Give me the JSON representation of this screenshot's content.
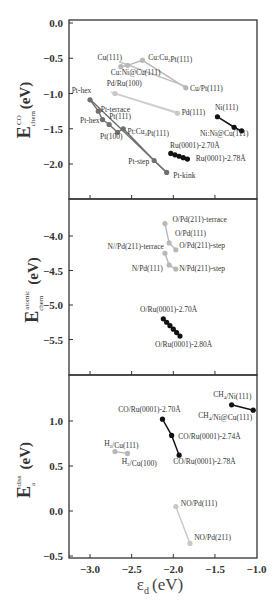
{
  "chart_data": [
    {
      "type": "scatter",
      "panel": "top",
      "ylabel": "E_chem^CO (eV)",
      "ylabel_main": "E",
      "ylabel_sup": "CO",
      "ylabel_sub": "chem",
      "ylabel_unit": "(eV)",
      "ylim": [
        -2.4,
        0.0
      ],
      "yticks": [
        "0.0",
        "-0.5",
        "-1.0",
        "-1.5",
        "-2.0"
      ],
      "ytick_values": [
        0.0,
        -0.5,
        -1.0,
        -1.5,
        -2.0
      ],
      "series": [
        {
          "name": "Cu-group",
          "color": "#b8b8b8",
          "points": [
            {
              "label": "Cu(111)",
              "x": -2.63,
              "y": -0.62
            },
            {
              "label": "Cu:Ni@Cu(111)",
              "x": -2.55,
              "y": -0.6
            },
            {
              "label": "Cu:Cu3Pt(111)",
              "x": -2.37,
              "y": -0.53
            },
            {
              "label": "Cu/Pt(111)",
              "x": -1.85,
              "y": -0.92
            }
          ]
        },
        {
          "name": "Pd-group",
          "color": "#c8c8c8",
          "points": [
            {
              "label": "Pd/Ru(100)",
              "x": -2.7,
              "y": -1.0
            },
            {
              "label": "Pd(111)",
              "x": -1.95,
              "y": -1.28
            }
          ]
        },
        {
          "name": "Pt-group",
          "color": "#707070",
          "points": [
            {
              "label": "Pt-hex",
              "x": -3.0,
              "y": -1.09
            },
            {
              "label": "Pt-terrace",
              "x": -2.9,
              "y": -1.25
            },
            {
              "label": "Pt-hex",
              "x": -2.85,
              "y": -1.37
            },
            {
              "label": "Pt(111)",
              "x": -2.77,
              "y": -1.44
            },
            {
              "label": "Pt(100)",
              "x": -2.67,
              "y": -1.55
            },
            {
              "label": "Pt:Cu3Pt(111)",
              "x": -2.6,
              "y": -1.5
            },
            {
              "label": "Pt-step",
              "x": -2.23,
              "y": -1.95
            },
            {
              "label": "Pt-kink",
              "x": -2.08,
              "y": -2.12
            }
          ]
        },
        {
          "name": "Ni-group",
          "color": "#111111",
          "points": [
            {
              "label": "Ni(111)",
              "x": -1.47,
              "y": -1.33
            },
            {
              "label": "",
              "x": -1.27,
              "y": -1.48
            },
            {
              "label": "Ni:Ni@Cu(111)",
              "x": -1.18,
              "y": -1.53
            }
          ]
        },
        {
          "name": "Ru(0001) strain",
          "color": "#111111",
          "points": [
            {
              "label": "Ru(0001)-2.70Å",
              "x": -2.03,
              "y": -1.85
            },
            {
              "label": "",
              "x": -1.98,
              "y": -1.87
            },
            {
              "label": "",
              "x": -1.93,
              "y": -1.89
            },
            {
              "label": "",
              "x": -1.88,
              "y": -1.91
            },
            {
              "label": "Ru(0001)-2.78Å",
              "x": -1.83,
              "y": -1.93
            }
          ]
        }
      ],
      "lines": [
        {
          "color": "#c0c0c0",
          "from": [
            -2.65,
            -0.55
          ],
          "to": [
            -1.85,
            -0.9
          ]
        },
        {
          "color": "#d0d0d0",
          "from": [
            -2.75,
            -0.98
          ],
          "to": [
            -1.95,
            -1.27
          ]
        },
        {
          "color": "#707070",
          "from": [
            -3.0,
            -1.08
          ],
          "to": [
            -2.08,
            -2.12
          ]
        },
        {
          "color": "#222222",
          "from": [
            -1.47,
            -1.33
          ],
          "to": [
            -1.18,
            -1.54
          ]
        },
        {
          "color": "#111111",
          "from": [
            -2.03,
            -1.85
          ],
          "to": [
            -1.83,
            -1.93
          ]
        }
      ],
      "annotations": [
        {
          "text": "Cu(111)",
          "x": -2.91,
          "y": -0.52
        },
        {
          "text": "Cu:Cu3Pt(111)",
          "x": -2.3,
          "y": -0.52
        },
        {
          "text": "Cu:Ni@Cu(111)",
          "x": -2.75,
          "y": -0.74
        },
        {
          "text": "Pd/Ru(100)",
          "x": -2.8,
          "y": -0.9
        },
        {
          "text": "Cu/Pt(111)",
          "x": -1.8,
          "y": -0.97
        },
        {
          "text": "Pt-hex",
          "x": -3.22,
          "y": -0.99
        },
        {
          "text": "Pt-terrace",
          "x": -2.87,
          "y": -1.26
        },
        {
          "text": "Pd(111)",
          "x": -1.9,
          "y": -1.3
        },
        {
          "text": "Ni(111)",
          "x": -1.5,
          "y": -1.24
        },
        {
          "text": "Pt(111)",
          "x": -2.77,
          "y": -1.36
        },
        {
          "text": "Pt-hex",
          "x": -3.12,
          "y": -1.42
        },
        {
          "text": "Pt:Cu3Pt(111)",
          "x": -2.55,
          "y": -1.58
        },
        {
          "text": "Ni:Ni@Cu(111)",
          "x": -1.68,
          "y": -1.6
        },
        {
          "text": "Pt(100)",
          "x": -2.88,
          "y": -1.65
        },
        {
          "text": "Ru(0001)-2.70Å",
          "x": -2.04,
          "y": -1.77
        },
        {
          "text": "Ru(0001)-2.78Å",
          "x": -1.73,
          "y": -1.96
        },
        {
          "text": "Pt-step",
          "x": -2.54,
          "y": -2.0
        },
        {
          "text": "Pt-kink",
          "x": -2.0,
          "y": -2.2
        }
      ]
    },
    {
      "type": "scatter",
      "panel": "middle",
      "ylabel": "E_chem^atomic (eV)",
      "ylabel_main": "E",
      "ylabel_sup": "atomic",
      "ylabel_sub": "chem",
      "ylabel_unit": "(eV)",
      "ylim": [
        -5.95,
        -3.6
      ],
      "yticks": [
        "-4.0",
        "-4.5",
        "-5.0",
        "-5.5"
      ],
      "ytick_values": [
        -4.0,
        -4.5,
        -5.0,
        -5.5
      ],
      "series": [
        {
          "name": "O/Pd",
          "color": "#b8b8b8",
          "points": [
            {
              "label": "O/Pd(211)-terrace",
              "x": -2.1,
              "y": -3.82
            },
            {
              "label": "O/Pd(111)",
              "x": -2.05,
              "y": -4.1
            },
            {
              "label": "O/Pd(211)-step",
              "x": -1.97,
              "y": -4.2
            }
          ]
        },
        {
          "name": "N/Pd",
          "color": "#b8b8b8",
          "points": [
            {
              "label": "N//Pd(211)-terrace",
              "x": -2.1,
              "y": -4.25
            },
            {
              "label": "N/Pd(111)",
              "x": -2.05,
              "y": -4.42
            },
            {
              "label": "N/Pd(211)-step",
              "x": -1.97,
              "y": -4.48
            }
          ]
        },
        {
          "name": "O/Ru(0001) strain",
          "color": "#111111",
          "points": [
            {
              "label": "O/Ru(0001)-2.70Å",
              "x": -2.12,
              "y": -5.2
            },
            {
              "label": "",
              "x": -2.08,
              "y": -5.25
            },
            {
              "label": "",
              "x": -2.04,
              "y": -5.3
            },
            {
              "label": "",
              "x": -2.0,
              "y": -5.35
            },
            {
              "label": "",
              "x": -1.96,
              "y": -5.4
            },
            {
              "label": "O/Ru(0001)-2.80Å",
              "x": -1.92,
              "y": -5.45
            }
          ]
        }
      ],
      "annotations": [
        {
          "text": "O/Pd(211)-terrace",
          "x": -2.01,
          "y": -3.8
        },
        {
          "text": "O/Pd(111)",
          "x": -1.98,
          "y": -4.0
        },
        {
          "text": "O/Pd(211)-step",
          "x": -1.93,
          "y": -4.18
        },
        {
          "text": "N//Pd(211)-terrace",
          "x": -2.79,
          "y": -4.19
        },
        {
          "text": "N/Pd(111)",
          "x": -2.5,
          "y": -4.5
        },
        {
          "text": "N/Pd(211)-step",
          "x": -1.93,
          "y": -4.5
        },
        {
          "text": "O/Ru(0001)-2.70Å",
          "x": -2.4,
          "y": -5.1
        },
        {
          "text": "O/Ru(0001)-2.80Å",
          "x": -2.22,
          "y": -5.61
        }
      ]
    },
    {
      "type": "scatter",
      "panel": "bottom",
      "xlabel": "ε_d (eV)",
      "xlabel_main": "ε",
      "xlabel_sub": "d",
      "xlabel_unit": "(eV)",
      "xlim": [
        -3.25,
        -1.0
      ],
      "xticks": [
        "-3.0",
        "-2.5",
        "-2.0",
        "-1.5",
        "-1.0"
      ],
      "xtick_values": [
        -3.0,
        -2.5,
        -2.0,
        -1.5,
        -1.0
      ],
      "ylabel": "E_a^diss (eV)",
      "ylabel_main": "E",
      "ylabel_sup": "diss",
      "ylabel_sub": "a",
      "ylabel_unit": "(eV)",
      "ylim": [
        -0.5,
        1.5
      ],
      "yticks": [
        "1.0",
        "0.5",
        "0.0",
        "-0.5"
      ],
      "ytick_values": [
        1.0,
        0.5,
        0.0,
        -0.5
      ],
      "series": [
        {
          "name": "CH4/Ni",
          "color": "#111111",
          "points": [
            {
              "label": "CH4/Ni(111)",
              "x": -1.3,
              "y": 1.18
            },
            {
              "label": "CH4/Ni@Cu(111)",
              "x": -1.04,
              "y": 1.12
            }
          ]
        },
        {
          "name": "CO/Ru(0001) strain",
          "color": "#111111",
          "points": [
            {
              "label": "CO/Ru(0001)-2.70Å",
              "x": -2.13,
              "y": 1.02
            },
            {
              "label": "CO/Ru(0001)-2.74Å",
              "x": -2.02,
              "y": 0.84
            },
            {
              "label": "CO/Ru(0001)-2.78Å",
              "x": -1.93,
              "y": 0.62
            }
          ]
        },
        {
          "name": "H2/Cu",
          "color": "#b8b8b8",
          "points": [
            {
              "label": "H2/Cu(111)",
              "x": -2.7,
              "y": 0.66
            },
            {
              "label": "H2/Cu(100)",
              "x": -2.55,
              "y": 0.64
            }
          ]
        },
        {
          "name": "NO/Pd",
          "color": "#c8c8c8",
          "points": [
            {
              "label": "NO/Pd(111)",
              "x": -1.97,
              "y": 0.05
            },
            {
              "label": "NO/Pd(211)",
              "x": -1.8,
              "y": -0.36
            }
          ]
        }
      ],
      "annotations": [
        {
          "text": "CH4/Ni(111)",
          "x": -1.52,
          "y": 1.27
        },
        {
          "text": "CO/Ru(0001)-2.70Å",
          "x": -2.66,
          "y": 1.1
        },
        {
          "text": "CH4/Ni@Cu(111)",
          "x": -1.7,
          "y": 1.03
        },
        {
          "text": "CO/Ru(0001)-2.74Å",
          "x": -1.94,
          "y": 0.8
        },
        {
          "text": "H2/Cu(111)",
          "x": -2.83,
          "y": 0.72
        },
        {
          "text": "H2/Cu(100)",
          "x": -2.62,
          "y": 0.52
        },
        {
          "text": "CO/Ru(0001)-2.78Å",
          "x": -2.0,
          "y": 0.52
        },
        {
          "text": "NO/Pd(111)",
          "x": -1.91,
          "y": 0.06
        },
        {
          "text": "NO/Pd(211)",
          "x": -1.75,
          "y": -0.32
        }
      ]
    }
  ]
}
